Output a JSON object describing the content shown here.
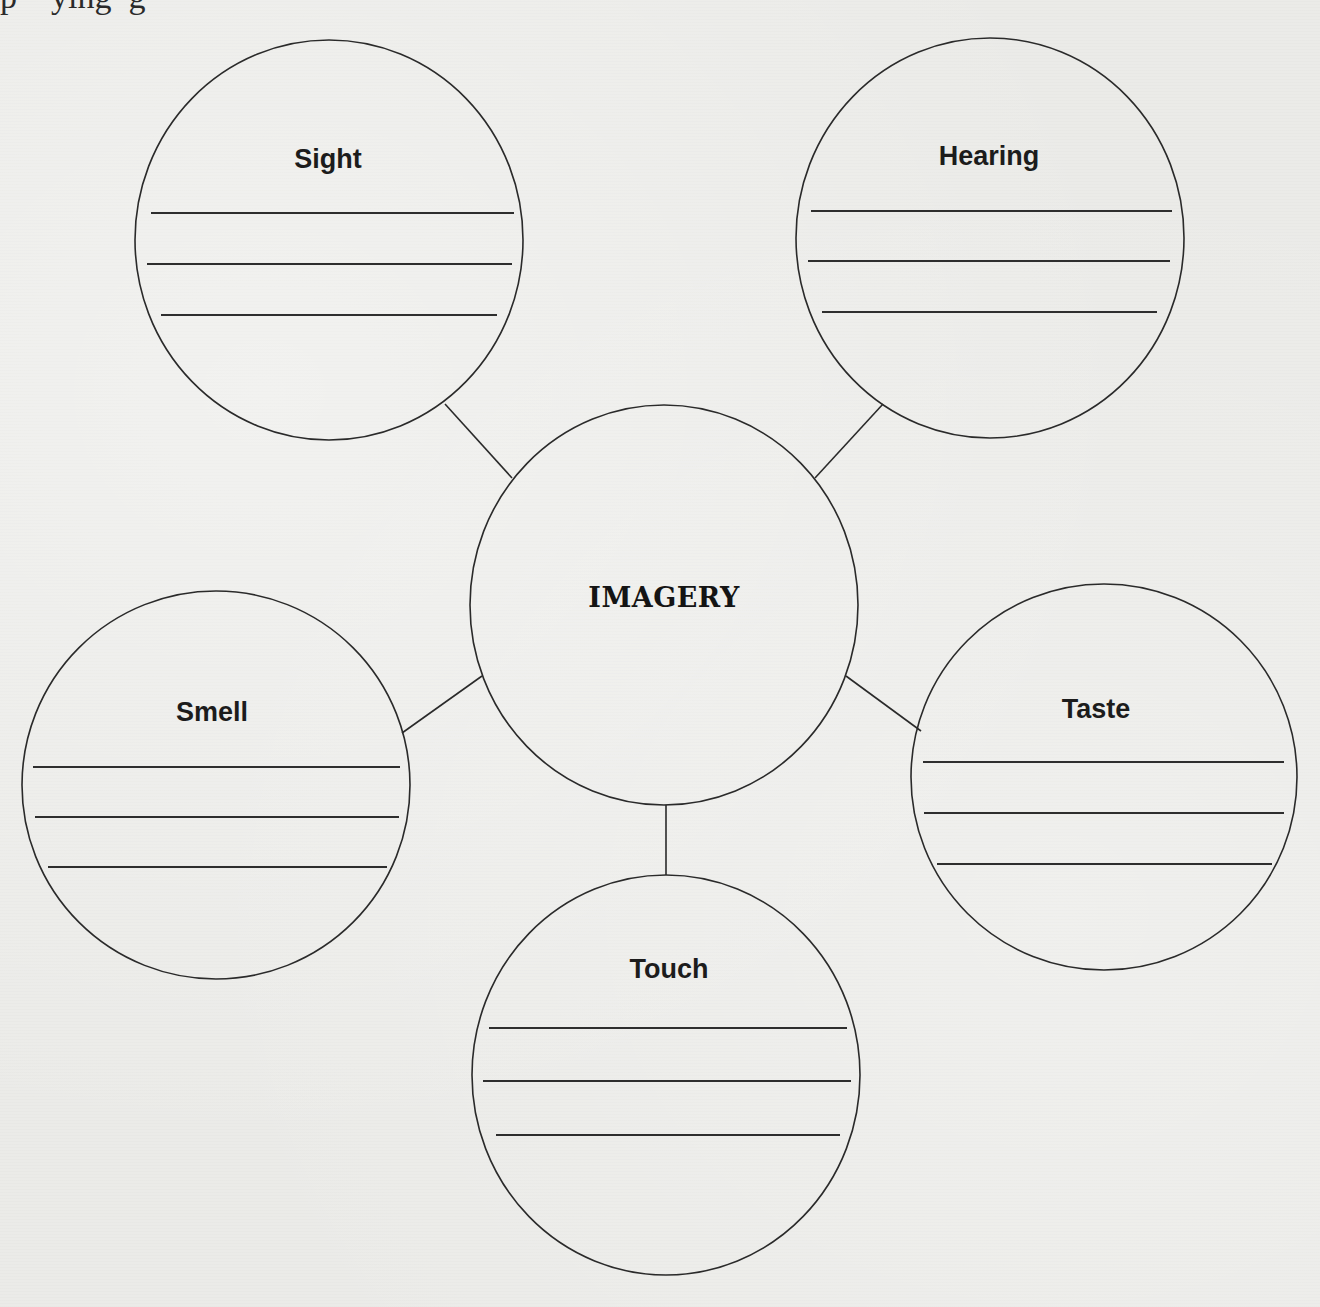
{
  "page": {
    "top_fragment": "p    ying  g",
    "background_color": "#ebebe8",
    "ink_color": "#2a2a2a"
  },
  "diagram": {
    "center": {
      "label": "IMAGERY",
      "cx": 664,
      "cy": 605,
      "rx": 194,
      "ry": 200
    },
    "nodes": [
      {
        "id": "sight",
        "label": "Sight",
        "cx": 329,
        "cy": 240,
        "rx": 194,
        "ry": 200,
        "label_x": 328,
        "label_y": 168,
        "answer_lines": [
          {
            "x1": 151,
            "x2": 514,
            "y": 213
          },
          {
            "x1": 147,
            "x2": 512,
            "y": 264
          },
          {
            "x1": 161,
            "x2": 497,
            "y": 315
          }
        ],
        "connector": {
          "x1": 445,
          "y1": 404,
          "x2": 512,
          "y2": 478
        }
      },
      {
        "id": "hearing",
        "label": "Hearing",
        "cx": 990,
        "cy": 238,
        "rx": 194,
        "ry": 200,
        "label_x": 989,
        "label_y": 165,
        "answer_lines": [
          {
            "x1": 811,
            "x2": 1172,
            "y": 211
          },
          {
            "x1": 808,
            "x2": 1170,
            "y": 261
          },
          {
            "x1": 822,
            "x2": 1157,
            "y": 312
          }
        ],
        "connector": {
          "x1": 883,
          "y1": 404,
          "x2": 815,
          "y2": 478
        }
      },
      {
        "id": "smell",
        "label": "Smell",
        "cx": 216,
        "cy": 785,
        "rx": 194,
        "ry": 194,
        "label_x": 212,
        "label_y": 721,
        "answer_lines": [
          {
            "x1": 33,
            "x2": 400,
            "y": 767
          },
          {
            "x1": 35,
            "x2": 399,
            "y": 817
          },
          {
            "x1": 48,
            "x2": 387,
            "y": 867
          }
        ],
        "connector": {
          "x1": 402,
          "y1": 733,
          "x2": 482,
          "y2": 676
        }
      },
      {
        "id": "taste",
        "label": "Taste",
        "cx": 1104,
        "cy": 777,
        "rx": 193,
        "ry": 193,
        "label_x": 1096,
        "label_y": 718,
        "answer_lines": [
          {
            "x1": 923,
            "x2": 1284,
            "y": 762
          },
          {
            "x1": 924,
            "x2": 1284,
            "y": 813
          },
          {
            "x1": 937,
            "x2": 1272,
            "y": 864
          }
        ],
        "connector": {
          "x1": 846,
          "y1": 676,
          "x2": 921,
          "y2": 731
        }
      },
      {
        "id": "touch",
        "label": "Touch",
        "cx": 666,
        "cy": 1075,
        "rx": 194,
        "ry": 200,
        "label_x": 669,
        "label_y": 978,
        "answer_lines": [
          {
            "x1": 489,
            "x2": 847,
            "y": 1028
          },
          {
            "x1": 483,
            "x2": 851,
            "y": 1081
          },
          {
            "x1": 496,
            "x2": 840,
            "y": 1135
          }
        ],
        "connector": {
          "x1": 666,
          "y1": 805,
          "x2": 666,
          "y2": 875
        }
      }
    ]
  }
}
